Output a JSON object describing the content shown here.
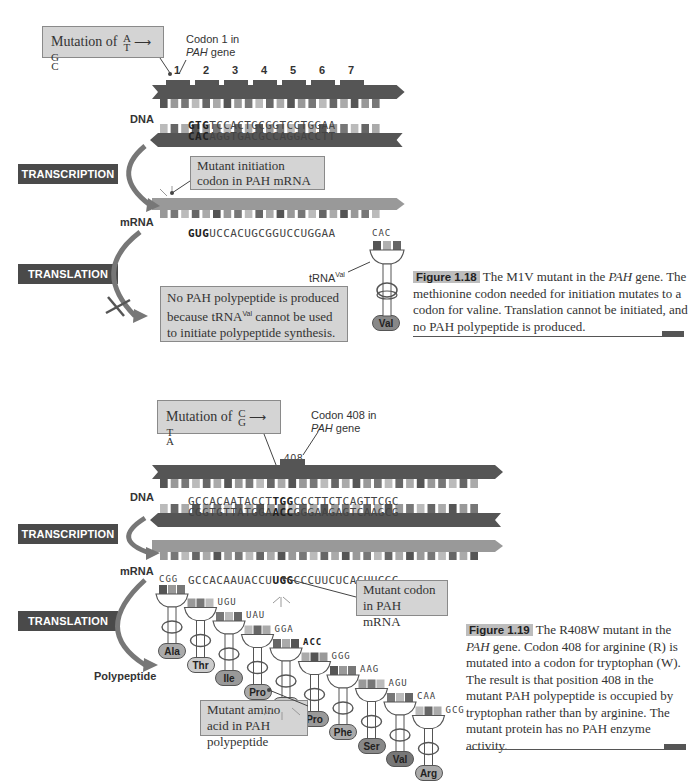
{
  "figure_1_18": {
    "mutation_callout": {
      "prefix": "Mutation of",
      "from_top": "A",
      "from_bottom": "T",
      "to_top": "G",
      "to_bottom": "C"
    },
    "codon_label_line1": "Codon 1 in",
    "codon_label_gene": "PAH",
    "codon_label_rest": " gene",
    "codon_numbers": [
      "1",
      "2",
      "3",
      "4",
      "5",
      "6",
      "7"
    ],
    "dna_label": "DNA",
    "dna_top_mutant": "GTG",
    "dna_top_rest": "TCCACTGCGGTCCTGGAA",
    "dna_bottom_mutant": "CAC",
    "dna_bottom_rest": "AGGTGACGCCAGGACCTT",
    "transcription_label": "TRANSCRIPTION",
    "mrna_callout": "Mutant initiation codon in PAH mRNA",
    "mrna_label": "mRNA",
    "mrna_mutant": "GUG",
    "mrna_rest": "UCCACUGCGGUCCUGGAA",
    "translation_label": "TRANSLATION",
    "trna_anticodon": "CAC",
    "trna_label": "tRNA",
    "trna_superscript": "Val",
    "amino_acid": "Val",
    "result_callout_line1": "No PAH polypeptide is produced",
    "result_callout_line2a": "because tRNA",
    "result_callout_line2sup": "Val",
    "result_callout_line2b": " cannot be used",
    "result_callout_line3": "to initiate polypeptide synthesis.",
    "caption_label": "Figure 1.18",
    "caption_text_a": "The M1V mutant in the ",
    "caption_text_italic": "PAH",
    "caption_text_b": " gene. The methionine codon needed for initiation mutates to a codon for valine. Translation cannot be initiated, and no PAH polypeptide is produced."
  },
  "figure_1_19": {
    "mutation_callout": {
      "prefix": "Mutation of",
      "from_top": "C",
      "from_bottom": "G",
      "to_top": "T",
      "to_bottom": "A"
    },
    "codon_label_line1": "Codon 408 in",
    "codon_label_gene": "PAH",
    "codon_label_rest": " gene",
    "codon_number": "408",
    "dna_label": "DNA",
    "dna_top_pre": "GCCACAATACCT",
    "dna_top_mutant": "TGG",
    "dna_top_post": "CCCTTCTCAGTTCGC",
    "dna_bottom_pre": "CGGTGTTATGGA",
    "dna_bottom_mutant": "ACC",
    "dna_bottom_post": "GGGAAGAGTCAAGCG",
    "transcription_label": "TRANSCRIPTION",
    "mrna_label": "mRNA",
    "mrna_pre": "GCCACAAUACCU",
    "mrna_mutant": "UGG",
    "mrna_post": "CCCUUCUCAGUUCGC",
    "mrna_callout": "Mutant codon in PAH mRNA",
    "translation_label": "TRANSLATION",
    "polypeptide_label": "Polypeptide",
    "trnas": [
      {
        "anticodon": "CGG",
        "amino_acid": "Ala"
      },
      {
        "anticodon": "UGU",
        "amino_acid": "Thr"
      },
      {
        "anticodon": "UAU",
        "amino_acid": "Ile"
      },
      {
        "anticodon": "GGA",
        "amino_acid": "Pro"
      },
      {
        "anticodon": "ACC",
        "amino_acid": "Trp"
      },
      {
        "anticodon": "GGG",
        "amino_acid": "Pro"
      },
      {
        "anticodon": "AAG",
        "amino_acid": "Phe"
      },
      {
        "anticodon": "AGU",
        "amino_acid": "Ser"
      },
      {
        "anticodon": "CAA",
        "amino_acid": "Val"
      },
      {
        "anticodon": "GCG",
        "amino_acid": "Arg"
      }
    ],
    "amino_acid_callout": "Mutant amino acid in PAH polypeptide",
    "caption_label": "Figure 1.19",
    "caption_text_a": "The R408W mutant in the ",
    "caption_text_italic": "PAH",
    "caption_text_b": " gene. Codon 408 for arginine (R) is mutated into a codon for tryptophan (W). The result is that position 408 in the mutant PAH polypeptide is occupied by tryptophan rather than by arginine. The mutant protein has no PAH enzyme activity."
  },
  "colors": {
    "dark": "#555555",
    "mid": "#888888",
    "light": "#b8b8b8",
    "callout_bg": "#d4d4d4",
    "stage_bg": "#4a4a4a"
  }
}
